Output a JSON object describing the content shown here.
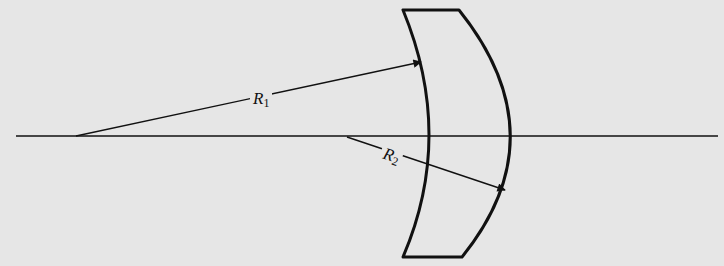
{
  "diagram": {
    "type": "optics-lens-radii",
    "colors": {
      "background": "#e6e6e6",
      "ink": "#111111"
    },
    "optical_axis": {
      "x1": 16,
      "x2": 718,
      "y": 136
    },
    "lens": {
      "path": "M403,10 L459,10 Q560,136 462,257 L403,257 Q455,136 403,10 Z"
    },
    "radii": [
      {
        "id": "R1",
        "label_main": "R",
        "label_sub": "1",
        "from": [
          76,
          136
        ],
        "to": [
          421,
          62
        ],
        "label_pos": [
          252,
          90
        ]
      },
      {
        "id": "R2",
        "label_main": "R",
        "label_sub": "2",
        "from": [
          347,
          137
        ],
        "to": [
          505,
          190
        ],
        "label_pos": [
          384,
          148
        ]
      }
    ]
  }
}
